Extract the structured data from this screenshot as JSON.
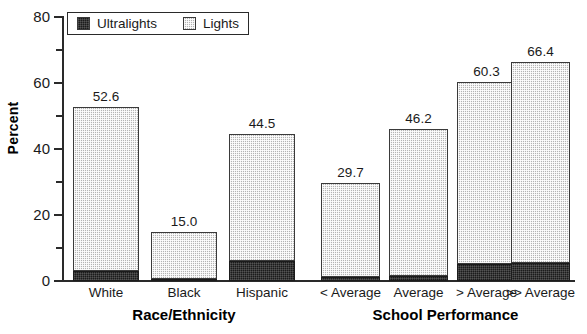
{
  "chart_data": {
    "type": "bar",
    "title": "",
    "subtitle": "",
    "xlabel": "",
    "ylabel": "Percent",
    "ylim": [
      0,
      80
    ],
    "y_ticks": [
      0,
      20,
      40,
      60,
      80
    ],
    "y_minor_ticks": [
      10,
      30,
      50,
      70
    ],
    "grid": false,
    "stacked": true,
    "legend_position": "top-left",
    "legend": [
      "Ultralights",
      "Lights"
    ],
    "series": [
      {
        "name": "Ultralights",
        "color": "#1b1b1b",
        "values": [
          3.0,
          0.6,
          6.2,
          1.1,
          1.6,
          5.0,
          5.6
        ]
      },
      {
        "name": "Lights",
        "color": "#b4b4b4",
        "values": [
          49.6,
          14.4,
          38.3,
          28.6,
          44.6,
          55.3,
          60.8
        ]
      }
    ],
    "categories": [
      "White",
      "Black",
      "Hispanic",
      "< Average",
      "Average",
      "> Average",
      ">> Average"
    ],
    "totals": [
      52.6,
      15.0,
      44.5,
      29.7,
      46.2,
      60.3,
      66.4
    ],
    "data_labels": [
      "52.6",
      "15.0",
      "44.5",
      "29.7",
      "46.2",
      "60.3",
      "66.4"
    ],
    "groups": [
      {
        "title": "Race/Ethnicity",
        "categories": [
          "White",
          "Black",
          "Hispanic"
        ]
      },
      {
        "title": "School Performance",
        "categories": [
          "< Average",
          "Average",
          "> Average",
          ">> Average"
        ]
      }
    ]
  },
  "axis": {
    "y_title": "Percent",
    "y_tick_labels": [
      "0",
      "20",
      "40",
      "60",
      "80"
    ]
  },
  "legend": {
    "items": [
      {
        "label": "Ultralights",
        "swatch": "black-solid-swatch"
      },
      {
        "label": "Lights",
        "swatch": "gray-hatched-swatch"
      }
    ]
  },
  "group_titles": {
    "left": "Race/Ethnicity",
    "right": "School Performance"
  },
  "bars": [
    {
      "category": "White",
      "label": "52.6",
      "total": 52.6,
      "ultralights": 3.0,
      "lights": 49.6,
      "x": 73,
      "width": 66
    },
    {
      "category": "Black",
      "label": "15.0",
      "total": 15.0,
      "ultralights": 0.6,
      "lights": 14.4,
      "x": 151,
      "width": 66
    },
    {
      "category": "Hispanic",
      "label": "44.5",
      "total": 44.5,
      "ultralights": 6.2,
      "lights": 38.3,
      "x": 229,
      "width": 66
    },
    {
      "category": "< Average",
      "label": "29.7",
      "total": 29.7,
      "ultralights": 1.1,
      "lights": 28.6,
      "x": 321,
      "width": 59
    },
    {
      "category": "Average",
      "label": "46.2",
      "total": 46.2,
      "ultralights": 1.6,
      "lights": 44.6,
      "x": 389,
      "width": 59
    },
    {
      "category": "> Average",
      "label": "60.3",
      "total": 60.3,
      "ultralights": 5.0,
      "lights": 55.3,
      "x": 457,
      "width": 59
    },
    {
      "category": ">> Average",
      "label": "66.4",
      "total": 66.4,
      "ultralights": 5.6,
      "lights": 60.8,
      "x": 511,
      "width": 59
    }
  ]
}
